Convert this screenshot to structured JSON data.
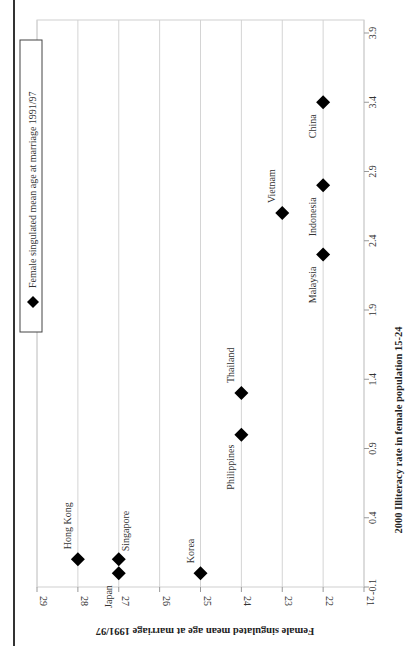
{
  "chart_data": {
    "type": "scatter",
    "orientation": "rotated 90 degrees counter-clockwise (page printed landscape)",
    "title": "",
    "xlabel": "2000 Illiteracy rate in female population 15-24",
    "ylabel": "Female singulated mean age at marriage 1991/97",
    "xlim": [
      -0.1,
      3.9
    ],
    "ylim": [
      21,
      29
    ],
    "x_ticks": [
      "-0.1",
      "0.4",
      "0.9",
      "1.4",
      "1.9",
      "2.4",
      "2.9",
      "3.4",
      "3.9"
    ],
    "y_ticks": [
      "21",
      "22",
      "23",
      "24",
      "25",
      "26",
      "27",
      "28",
      "29"
    ],
    "grid": true,
    "legend": {
      "position": "top-left (rotated frame)",
      "entries": [
        "Female singulated mean age at marriage 1991/97"
      ]
    },
    "marker": "diamond",
    "series": [
      {
        "name": "Female singulated mean age at marriage 1991/97",
        "points": [
          {
            "label": "Hong Kong",
            "x": 0.1,
            "y": 28
          },
          {
            "label": "Singapore",
            "x": 0.1,
            "y": 27
          },
          {
            "label": "Japan",
            "x": 0.0,
            "y": 27
          },
          {
            "label": "Korea",
            "x": 0.0,
            "y": 25
          },
          {
            "label": "Philippines",
            "x": 1.0,
            "y": 24
          },
          {
            "label": "Thailand",
            "x": 1.3,
            "y": 24
          },
          {
            "label": "Vietnam",
            "x": 2.6,
            "y": 23
          },
          {
            "label": "Malaysia",
            "x": 2.3,
            "y": 22
          },
          {
            "label": "Indonesia",
            "x": 2.8,
            "y": 22
          },
          {
            "label": "China",
            "x": 3.4,
            "y": 22
          }
        ]
      }
    ]
  },
  "colors": {
    "marker": "#000000",
    "grid": "#d4d4d4",
    "rule": "#333333"
  }
}
